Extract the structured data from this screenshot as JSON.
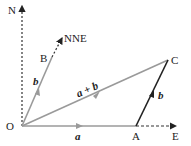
{
  "diagram": {
    "points": {
      "O": {
        "label": "O",
        "x": 22,
        "y": 126
      },
      "A": {
        "label": "A",
        "x": 136,
        "y": 126
      },
      "B": {
        "label": "B",
        "x": 52,
        "y": 57
      },
      "C": {
        "label": "C",
        "x": 168,
        "y": 60
      }
    },
    "directions": {
      "north": "N",
      "east": "E",
      "nne": "NNE"
    },
    "vectors": {
      "a": "a",
      "b": "b",
      "sum": "a + b",
      "b_translated": "b"
    },
    "colors": {
      "gray_vector": "#9a9a9a",
      "dark_vector": "#222222",
      "dashed_axis": "#333333"
    }
  }
}
